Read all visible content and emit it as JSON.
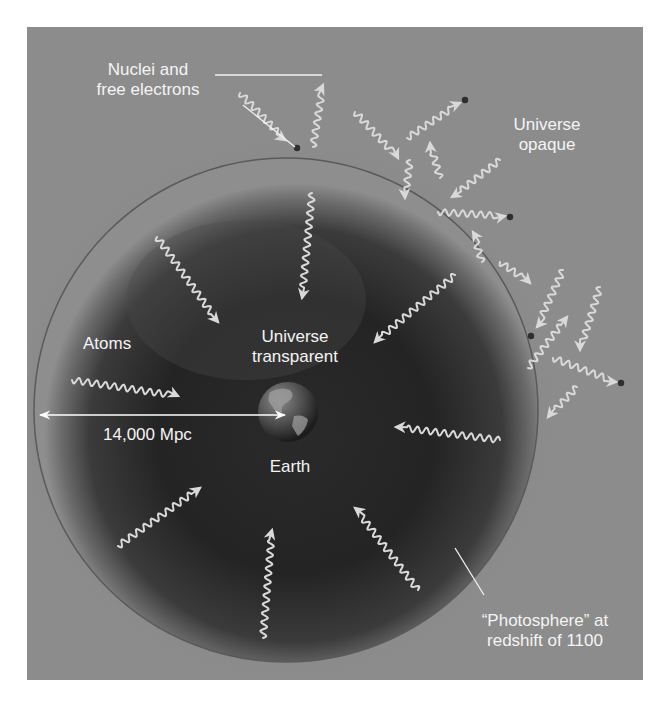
{
  "figure": {
    "background": "#8c8c8c",
    "sphere_center": "#262626",
    "sphere_edge": "#9a9a9a",
    "wave_color": "#d9d9d9",
    "label_color": "#f4f4f4"
  },
  "labels": {
    "nuclei_line1": "Nuclei and",
    "nuclei_line2": "free electrons",
    "opaque_line1": "Universe",
    "opaque_line2": "opaque",
    "atoms": "Atoms",
    "transparent_line1": "Universe",
    "transparent_line2": "transparent",
    "distance": "14,000 Mpc",
    "earth": "Earth",
    "photosphere_line1": "“Photosphere” at",
    "photosphere_line2": "redshift of 1100"
  },
  "diagram": {
    "sphere": {
      "cx": 286,
      "cy": 410,
      "r": 252
    },
    "earth": {
      "cx": 288,
      "cy": 412,
      "r": 30
    },
    "distance_arrow": {
      "x1": 40,
      "y1": 415,
      "x2": 285,
      "y2": 415
    },
    "leaders": [
      {
        "x1": 215,
        "y1": 75,
        "x2": 295,
        "y2": 75,
        "x3": 322,
        "y3": 75
      },
      {
        "x1": 243,
        "y1": 105,
        "x2": 295,
        "y2": 147
      },
      {
        "x1": 484,
        "y1": 595,
        "x2": 455,
        "y2": 548
      }
    ],
    "dots": [
      {
        "cx": 297,
        "cy": 148
      },
      {
        "cx": 465,
        "cy": 100
      },
      {
        "cx": 510,
        "cy": 217
      },
      {
        "cx": 531,
        "cy": 336
      },
      {
        "cx": 621,
        "cy": 383
      }
    ],
    "arrows": [
      {
        "x1": 157,
        "y1": 237,
        "x2": 218,
        "y2": 322
      },
      {
        "x1": 312,
        "y1": 193,
        "x2": 302,
        "y2": 298
      },
      {
        "x1": 455,
        "y1": 275,
        "x2": 375,
        "y2": 342
      },
      {
        "x1": 72,
        "y1": 380,
        "x2": 178,
        "y2": 396
      },
      {
        "x1": 500,
        "y1": 440,
        "x2": 396,
        "y2": 427
      },
      {
        "x1": 118,
        "y1": 546,
        "x2": 200,
        "y2": 488
      },
      {
        "x1": 263,
        "y1": 638,
        "x2": 272,
        "y2": 530
      },
      {
        "x1": 418,
        "y1": 590,
        "x2": 355,
        "y2": 508
      },
      {
        "x1": 240,
        "y1": 93,
        "x2": 285,
        "y2": 140
      },
      {
        "x1": 313,
        "y1": 147,
        "x2": 323,
        "y2": 85
      },
      {
        "x1": 355,
        "y1": 112,
        "x2": 398,
        "y2": 158
      },
      {
        "x1": 410,
        "y1": 160,
        "x2": 405,
        "y2": 198
      },
      {
        "x1": 407,
        "y1": 138,
        "x2": 460,
        "y2": 103
      },
      {
        "x1": 440,
        "y1": 178,
        "x2": 430,
        "y2": 143
      },
      {
        "x1": 500,
        "y1": 160,
        "x2": 452,
        "y2": 197
      },
      {
        "x1": 438,
        "y1": 212,
        "x2": 505,
        "y2": 216
      },
      {
        "x1": 482,
        "y1": 262,
        "x2": 473,
        "y2": 232
      },
      {
        "x1": 500,
        "y1": 262,
        "x2": 530,
        "y2": 283
      },
      {
        "x1": 563,
        "y1": 270,
        "x2": 537,
        "y2": 327
      },
      {
        "x1": 600,
        "y1": 287,
        "x2": 580,
        "y2": 350
      },
      {
        "x1": 528,
        "y1": 368,
        "x2": 567,
        "y2": 317
      },
      {
        "x1": 553,
        "y1": 358,
        "x2": 616,
        "y2": 382
      },
      {
        "x1": 577,
        "y1": 387,
        "x2": 548,
        "y2": 417
      }
    ]
  }
}
